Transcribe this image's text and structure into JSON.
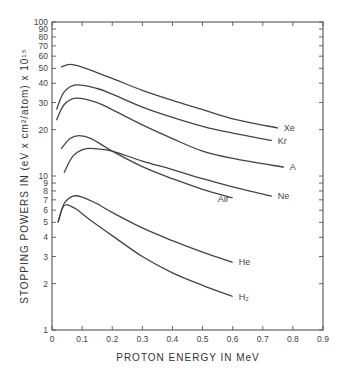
{
  "chart_data": {
    "type": "line",
    "title": "",
    "xlabel": "PROTON ENERGY IN MeV",
    "ylabel": "STOPPING POWERS IN (eV x cm²/atom) x 10¹⁵",
    "xlim": [
      0,
      0.9
    ],
    "ylim": [
      1,
      100
    ],
    "yscale": "log",
    "grid": false,
    "legend": "inline labels at curve ends",
    "x_ticks": [
      "0",
      "0.1",
      "0.2",
      "0.3",
      "0.4",
      "0.5",
      "0.6",
      "0.7",
      "0.8",
      "0.9"
    ],
    "y_ticks": [
      "1",
      "2",
      "3",
      "4",
      "5",
      "6",
      "7",
      "8",
      "9",
      "10",
      "20",
      "30",
      "40",
      "50",
      "60",
      "70",
      "80",
      "90",
      "100"
    ],
    "series": [
      {
        "name": "Xe",
        "x": [
          0.03,
          0.06,
          0.1,
          0.2,
          0.3,
          0.4,
          0.5,
          0.6,
          0.75
        ],
        "values": [
          51,
          53,
          51,
          43,
          36,
          31,
          27,
          23.5,
          20.5
        ]
      },
      {
        "name": "Kr",
        "x": [
          0.015,
          0.04,
          0.08,
          0.15,
          0.2,
          0.3,
          0.4,
          0.5,
          0.6,
          0.73
        ],
        "values": [
          27,
          35,
          39,
          37,
          34,
          28,
          24,
          21,
          19,
          17
        ]
      },
      {
        "name": "A",
        "x": [
          0.015,
          0.04,
          0.08,
          0.15,
          0.2,
          0.3,
          0.4,
          0.5,
          0.6,
          0.77
        ],
        "values": [
          23,
          29,
          32,
          30,
          27,
          21.5,
          17.5,
          14.5,
          13,
          11.4
        ]
      },
      {
        "name": "Air",
        "x": [
          0.03,
          0.06,
          0.09,
          0.13,
          0.2,
          0.3,
          0.4,
          0.5,
          0.6
        ],
        "values": [
          15,
          17.5,
          18.3,
          17.5,
          14.5,
          11.5,
          9.6,
          8.2,
          7.2
        ]
      },
      {
        "name": "Ne",
        "x": [
          0.04,
          0.07,
          0.11,
          0.15,
          0.2,
          0.3,
          0.4,
          0.5,
          0.6,
          0.73
        ],
        "values": [
          10.5,
          13.5,
          15,
          15,
          14.5,
          12.5,
          11,
          9.6,
          8.5,
          7.4
        ]
      },
      {
        "name": "He",
        "x": [
          0.02,
          0.04,
          0.07,
          0.1,
          0.15,
          0.2,
          0.3,
          0.4,
          0.5,
          0.6
        ],
        "values": [
          5,
          6.6,
          7.4,
          7.3,
          6.6,
          5.8,
          4.6,
          3.8,
          3.2,
          2.75
        ]
      },
      {
        "name": "H₂",
        "x": [
          0.02,
          0.035,
          0.05,
          0.08,
          0.12,
          0.2,
          0.3,
          0.4,
          0.5,
          0.6
        ],
        "values": [
          5,
          6.2,
          6.5,
          6.1,
          5.3,
          4.1,
          3.0,
          2.35,
          1.95,
          1.65
        ]
      }
    ]
  },
  "labels": {
    "xlabel": "PROTON ENERGY IN MeV",
    "ylabel": "STOPPING POWERS IN (eV x cm²/atom) x 10¹⁵",
    "series": [
      "Xe",
      "Kr",
      "A",
      "Air",
      "Ne",
      "He",
      "H₂"
    ]
  }
}
